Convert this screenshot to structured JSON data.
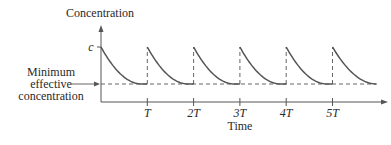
{
  "chart_data": {
    "type": "line",
    "title": "",
    "ylabel": "Concentration",
    "xlabel": "Time",
    "y_tick_labels": {
      "peak": "c"
    },
    "min_effective_label": [
      "Minimum",
      "effective",
      "concentration"
    ],
    "x_ticks": [
      {
        "value": 1,
        "label": "T"
      },
      {
        "value": 2,
        "label": "2T"
      },
      {
        "value": 3,
        "label": "3T"
      },
      {
        "value": 4,
        "label": "4T"
      },
      {
        "value": 5,
        "label": "5T"
      }
    ],
    "x_range_periods": [
      0,
      5.95
    ],
    "peak_level": 1.0,
    "min_effective_level": 0.0,
    "dose_times_periods": [
      0,
      1,
      2,
      3,
      4,
      5
    ],
    "curve_end_period": 5.95,
    "series": [
      {
        "name": "concentration",
        "pattern": "repeated exponential decay from c to minimum effective level each period T"
      }
    ],
    "grid": false,
    "legend": "none",
    "line_color": "#555555"
  }
}
